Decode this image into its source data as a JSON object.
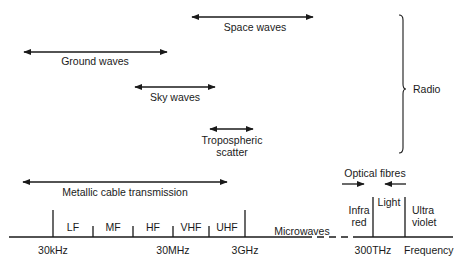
{
  "diagram": {
    "title": "",
    "ranges": {
      "space_waves": "Space waves",
      "ground_waves": "Ground waves",
      "sky_waves": "Sky waves",
      "tropospheric_line1": "Tropospheric",
      "tropospheric_line2": "scatter",
      "metallic_cable": "Metallic cable transmission",
      "optical_fibres": "Optical fibres"
    },
    "brace_label": "Radio",
    "bands": {
      "lf": "LF",
      "mf": "MF",
      "hf": "HF",
      "vhf": "VHF",
      "uhf": "UHF",
      "microwaves": "Microwaves",
      "infrared_line1": "Infra",
      "infrared_line2": "red",
      "light": "Light",
      "ultraviolet_line1": "Ultra",
      "ultraviolet_line2": "violet"
    },
    "axis": {
      "tick_30khz": "30kHz",
      "tick_30mhz": "30MHz",
      "tick_3ghz": "3GHz",
      "tick_300thz": "300THz",
      "label": "Frequency"
    },
    "line_color": "#1a1a1a"
  }
}
